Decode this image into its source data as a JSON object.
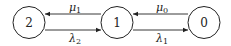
{
  "diagram": {
    "type": "birth-death chain",
    "nodes": [
      {
        "id": "2",
        "label": "2"
      },
      {
        "id": "1",
        "label": "1"
      },
      {
        "id": "0",
        "label": "0"
      }
    ],
    "edges": [
      {
        "from": "1",
        "to": "2",
        "symbol": "μ",
        "subscript": "1",
        "position": "upper"
      },
      {
        "from": "2",
        "to": "1",
        "symbol": "λ",
        "subscript": "2",
        "position": "lower"
      },
      {
        "from": "0",
        "to": "1",
        "symbol": "μ",
        "subscript": "0",
        "position": "upper"
      },
      {
        "from": "1",
        "to": "0",
        "symbol": "λ",
        "subscript": "1",
        "position": "lower"
      }
    ]
  }
}
